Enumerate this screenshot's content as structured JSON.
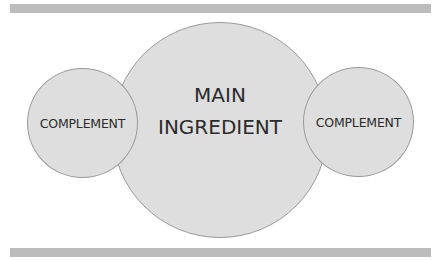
{
  "diagram": {
    "type": "overlapping-circles",
    "main": {
      "label_line1": "MAIN",
      "label_line2": "INGREDIENT"
    },
    "left": {
      "label": "COMPLEMENT"
    },
    "right": {
      "label": "COMPLEMENT"
    }
  },
  "colors": {
    "circle_fill": "#dedede",
    "circle_border": "#9a9a9a",
    "bar": "#bcbcbc",
    "text": "#2b2b2b"
  }
}
